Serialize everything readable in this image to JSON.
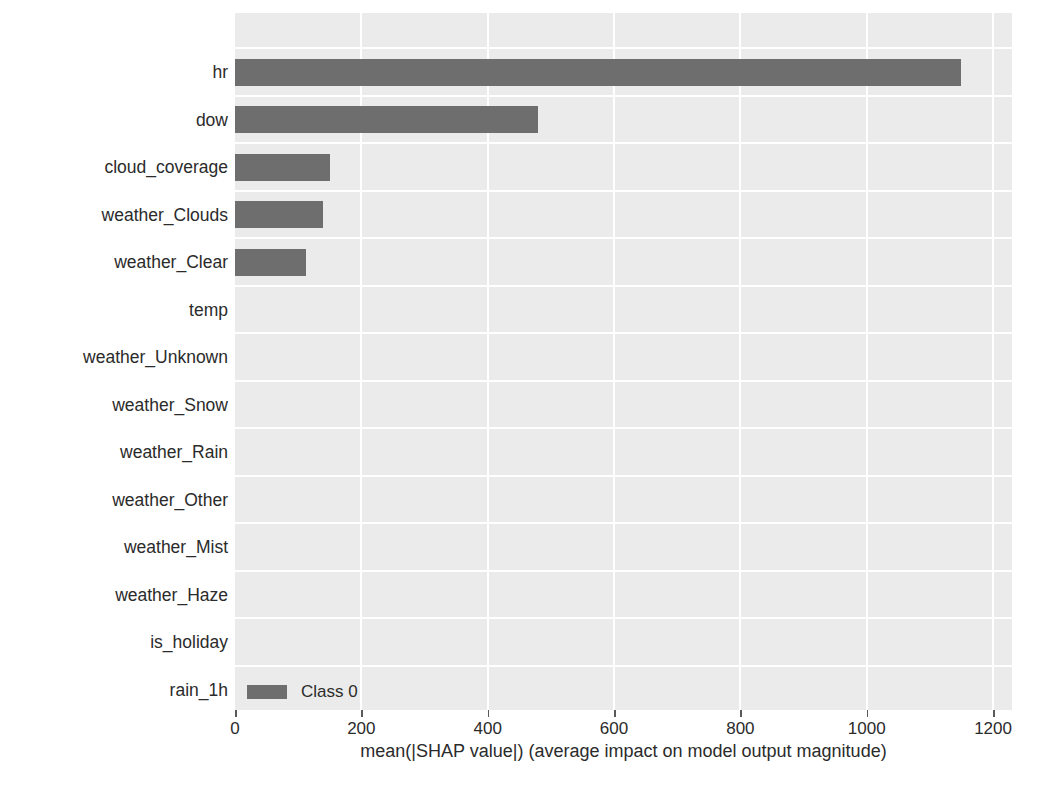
{
  "chart_data": {
    "type": "bar",
    "orientation": "horizontal",
    "title": "",
    "xlabel": "mean(|SHAP value|) (average impact on model output magnitude)",
    "ylabel": "",
    "xlim": [
      0,
      1230
    ],
    "xticks": [
      0,
      200,
      400,
      600,
      800,
      1000,
      1200
    ],
    "xtick_labels": [
      "0",
      "200",
      "400",
      "600",
      "800",
      "1000",
      "1200"
    ],
    "grid": true,
    "grid_color": "#ffffff",
    "panel_color": "#ebebeb",
    "bar_color": "#6e6e6e",
    "legend": {
      "position": "lower left (inside axes)",
      "entries": [
        {
          "label": "Class 0",
          "color": "#6e6e6e"
        }
      ]
    },
    "categories": [
      "hr",
      "dow",
      "cloud_coverage",
      "weather_Clouds",
      "weather_Clear",
      "temp",
      "weather_Unknown",
      "weather_Snow",
      "weather_Rain",
      "weather_Other",
      "weather_Mist",
      "weather_Haze",
      "is_holiday",
      "rain_1h"
    ],
    "series": [
      {
        "name": "Class 0",
        "values": [
          1150,
          480,
          150,
          139,
          112,
          0,
          0,
          0,
          0,
          0,
          0,
          0,
          0,
          0
        ]
      }
    ]
  }
}
